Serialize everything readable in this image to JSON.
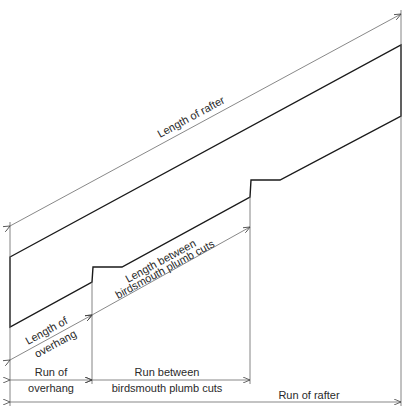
{
  "diagram": {
    "type": "rafter-layout",
    "labels": {
      "length_of_rafter": "Length of rafter",
      "length_between_1": "Length between",
      "length_between_2": "birdsmouth plumb cuts",
      "length_overhang_1": "Length of",
      "length_overhang_2": "overhang",
      "run_overhang_1": "Run of",
      "run_overhang_2": "overhang",
      "run_between_1": "Run between",
      "run_between_2": "birdsmouth plumb cuts",
      "run_of_rafter": "Run of rafter"
    },
    "colors": {
      "line": "#1a1a1a",
      "dimension": "#555555",
      "background": "#ffffff"
    }
  }
}
